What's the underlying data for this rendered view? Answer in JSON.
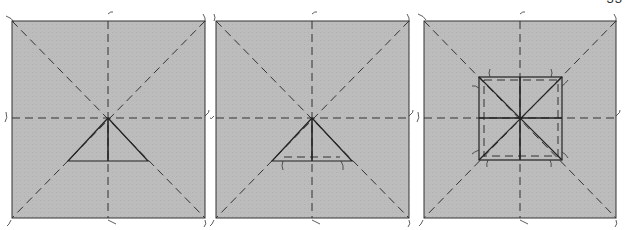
{
  "page_number": "33",
  "colors": {
    "panel_fill": "#b9b9b9",
    "line": "#2a2a2a",
    "background": "#ffffff"
  },
  "panels": [
    {
      "id": "panel-1",
      "box": {
        "x": 12,
        "y": 21,
        "w": 193,
        "h": 197
      },
      "center": {
        "x": 108,
        "y": 118
      },
      "figure": "triangle",
      "triangle": {
        "apex": [
          108,
          118
        ],
        "left": [
          68,
          161
        ],
        "right": [
          148,
          161
        ]
      },
      "dashed_base_offset": false
    },
    {
      "id": "panel-2",
      "box": {
        "x": 216,
        "y": 21,
        "w": 193,
        "h": 197
      },
      "center": {
        "x": 312,
        "y": 118
      },
      "figure": "triangle",
      "triangle": {
        "apex": [
          312,
          118
        ],
        "left": [
          272,
          161
        ],
        "right": [
          352,
          161
        ]
      },
      "dashed_base_offset": true
    },
    {
      "id": "panel-3",
      "box": {
        "x": 424,
        "y": 21,
        "w": 192,
        "h": 197
      },
      "center": {
        "x": 520,
        "y": 118
      },
      "figure": "square",
      "square": {
        "x": 479,
        "y": 77,
        "w": 83,
        "h": 83
      },
      "dashed_inner_offset": true
    }
  ]
}
